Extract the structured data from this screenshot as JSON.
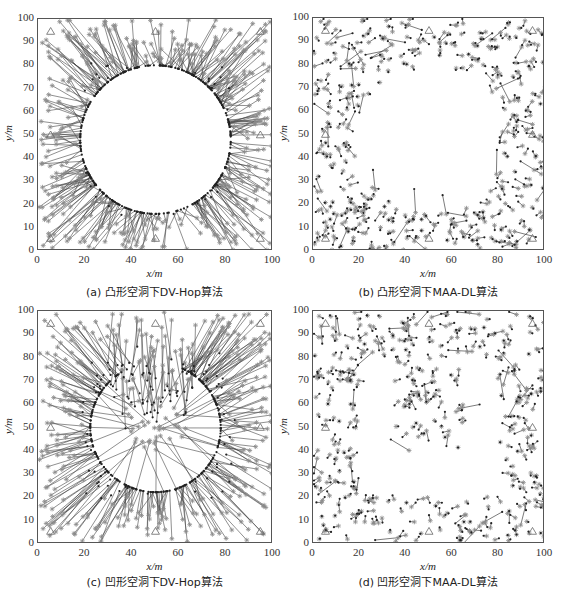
{
  "chart_data": [
    {
      "id": "a",
      "type": "scatter",
      "caption": "(a) 凸形空洞下DV-Hop算法",
      "title": "",
      "xlabel": "x/m",
      "ylabel": "y/m",
      "xlim": [
        0,
        100
      ],
      "ylim": [
        0,
        100
      ],
      "xticks": [
        0,
        20,
        40,
        60,
        80,
        100
      ],
      "yticks": [
        0,
        10,
        20,
        30,
        40,
        50,
        60,
        70,
        80,
        90,
        100
      ],
      "hole": {
        "shape": "circle",
        "center": [
          50,
          48
        ],
        "radius": 34
      },
      "algorithm": "DV-Hop",
      "error_style": "large radial errors pointing inward toward hole",
      "series": [
        {
          "name": "actual node",
          "marker": "asterisk",
          "color": "#888888"
        },
        {
          "name": "estimated position",
          "marker": "dot",
          "color": "#333333"
        },
        {
          "name": "error line",
          "marker": "line",
          "color": "#444444"
        },
        {
          "name": "anchor",
          "marker": "triangle",
          "color": "#666666",
          "points": [
            [
              5,
              95
            ],
            [
              50,
              95
            ],
            [
              95,
              95
            ],
            [
              5,
              50
            ],
            [
              95,
              50
            ],
            [
              5,
              5
            ],
            [
              50,
              5
            ],
            [
              95,
              5
            ]
          ]
        }
      ],
      "node_count_approx": 400,
      "seed": 11
    },
    {
      "id": "b",
      "type": "scatter",
      "caption": "(b) 凸形空洞下MAA-DL算法",
      "title": "",
      "xlabel": "x/m",
      "ylabel": "y/m",
      "xlim": [
        0,
        100
      ],
      "ylim": [
        0,
        100
      ],
      "xticks": [
        0,
        20,
        40,
        60,
        80,
        100
      ],
      "yticks": [
        0,
        10,
        20,
        30,
        40,
        50,
        60,
        70,
        80,
        90,
        100
      ],
      "hole": {
        "shape": "circle",
        "center": [
          50,
          48
        ],
        "radius": 32
      },
      "algorithm": "MAA-DL",
      "error_style": "small random errors",
      "series": [
        {
          "name": "actual node",
          "marker": "asterisk",
          "color": "#888888"
        },
        {
          "name": "estimated position",
          "marker": "dot",
          "color": "#333333"
        },
        {
          "name": "error line",
          "marker": "line",
          "color": "#444444"
        },
        {
          "name": "anchor",
          "marker": "triangle",
          "color": "#666666",
          "points": [
            [
              5,
              95
            ],
            [
              50,
              95
            ],
            [
              95,
              95
            ],
            [
              5,
              50
            ],
            [
              95,
              50
            ],
            [
              5,
              5
            ],
            [
              50,
              5
            ],
            [
              95,
              5
            ]
          ]
        }
      ],
      "node_count_approx": 400,
      "seed": 23
    },
    {
      "id": "c",
      "type": "scatter",
      "caption": "(c) 凹形空洞下DV-Hop算法",
      "title": "",
      "xlabel": "x/m",
      "ylabel": "y/m",
      "xlim": [
        0,
        100
      ],
      "ylim": [
        0,
        100
      ],
      "xticks": [
        0,
        20,
        40,
        60,
        80,
        100
      ],
      "yticks": [
        0,
        10,
        20,
        30,
        40,
        50,
        60,
        70,
        80,
        90,
        100
      ],
      "hole": {
        "shape": "U",
        "outer": [
          20,
          20,
          80,
          80
        ],
        "notch": [
          35,
          40,
          65,
          100
        ]
      },
      "algorithm": "DV-Hop",
      "error_style": "large radial errors pointing inward toward hole",
      "series": [
        {
          "name": "actual node",
          "marker": "asterisk",
          "color": "#888888"
        },
        {
          "name": "estimated position",
          "marker": "dot",
          "color": "#333333"
        },
        {
          "name": "error line",
          "marker": "line",
          "color": "#444444"
        },
        {
          "name": "anchor",
          "marker": "triangle",
          "color": "#666666",
          "points": [
            [
              5,
              95
            ],
            [
              50,
              95
            ],
            [
              95,
              95
            ],
            [
              5,
              50
            ],
            [
              95,
              50
            ],
            [
              5,
              5
            ],
            [
              50,
              5
            ],
            [
              95,
              5
            ]
          ]
        }
      ],
      "node_count_approx": 400,
      "seed": 37
    },
    {
      "id": "d",
      "type": "scatter",
      "caption": "(d) 凹形空洞下MAA-DL算法",
      "title": "",
      "xlabel": "x/m",
      "ylabel": "y/m",
      "xlim": [
        0,
        100
      ],
      "ylim": [
        0,
        100
      ],
      "xticks": [
        0,
        20,
        40,
        60,
        80,
        100
      ],
      "yticks": [
        0,
        10,
        20,
        30,
        40,
        50,
        60,
        70,
        80,
        90,
        100
      ],
      "hole": {
        "shape": "U",
        "outer": [
          20,
          20,
          80,
          80
        ],
        "notch": [
          35,
          40,
          65,
          100
        ]
      },
      "algorithm": "MAA-DL",
      "error_style": "small random errors",
      "series": [
        {
          "name": "actual node",
          "marker": "asterisk",
          "color": "#888888"
        },
        {
          "name": "estimated position",
          "marker": "dot",
          "color": "#333333"
        },
        {
          "name": "error line",
          "marker": "line",
          "color": "#444444"
        },
        {
          "name": "anchor",
          "marker": "triangle",
          "color": "#666666",
          "points": [
            [
              5,
              95
            ],
            [
              50,
              95
            ],
            [
              95,
              95
            ],
            [
              5,
              50
            ],
            [
              95,
              50
            ],
            [
              5,
              5
            ],
            [
              50,
              5
            ],
            [
              95,
              5
            ]
          ]
        }
      ],
      "node_count_approx": 400,
      "seed": 53
    }
  ],
  "layout": {
    "panels": [
      {
        "id": "a",
        "plot": [
          37,
          18,
          235,
          232
        ],
        "caption_y": 283
      },
      {
        "id": "b",
        "plot": [
          312,
          17,
          232,
          233
        ],
        "caption_y": 283
      },
      {
        "id": "c",
        "plot": [
          37,
          310,
          235,
          233
        ],
        "caption_y": 573
      },
      {
        "id": "d",
        "plot": [
          312,
          310,
          232,
          233
        ],
        "caption_y": 573
      }
    ]
  }
}
